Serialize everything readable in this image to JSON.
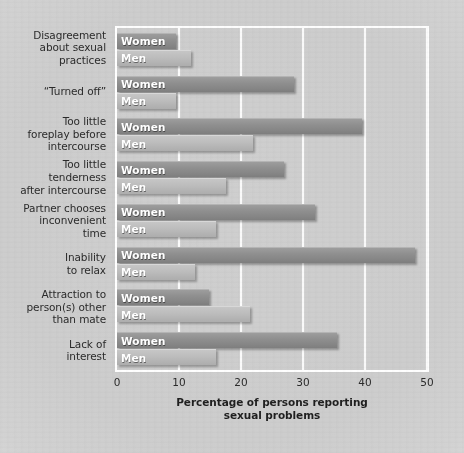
{
  "chart_data": {
    "type": "bar",
    "orientation": "horizontal",
    "title": "",
    "xlabel": "Percentage of persons reporting sexual problems",
    "ylabel": "",
    "xlim": [
      0,
      50
    ],
    "xticks": [
      0,
      10,
      20,
      30,
      40,
      50
    ],
    "grid": true,
    "legend": "in-bar labels",
    "series_names": [
      "Women",
      "Men"
    ],
    "categories": [
      "Disagreement about sexual practices",
      "“Turned off”",
      "Too little foreplay before intercourse",
      "Too little tenderness after intercourse",
      "Partner chooses inconvenient time",
      "Inability to relax",
      "Attraction to person(s) other than mate",
      "Lack of interest"
    ],
    "series": [
      {
        "name": "Women",
        "values": [
          9.5,
          28.5,
          39.5,
          27,
          32,
          48,
          14.8,
          35.5
        ]
      },
      {
        "name": "Men",
        "values": [
          12,
          9.5,
          22,
          17.5,
          16,
          12.5,
          21.5,
          16
        ]
      }
    ]
  },
  "categories": [
    {
      "lines": [
        "Disagreement",
        "about sexual",
        "practices"
      ],
      "women": 9.5,
      "men": 12
    },
    {
      "lines": [
        "“Turned off”"
      ],
      "women": 28.5,
      "men": 9.5
    },
    {
      "lines": [
        "Too little",
        "foreplay before",
        "intercourse"
      ],
      "women": 39.5,
      "men": 22
    },
    {
      "lines": [
        "Too little",
        "tenderness",
        "after intercourse"
      ],
      "women": 27,
      "men": 17.5
    },
    {
      "lines": [
        "Partner chooses",
        "inconvenient",
        "time"
      ],
      "women": 32,
      "men": 16
    },
    {
      "lines": [
        "Inability",
        "to relax"
      ],
      "women": 48,
      "men": 12.5
    },
    {
      "lines": [
        "Attraction to",
        "person(s) other",
        "than mate"
      ],
      "women": 14.8,
      "men": 21.5
    },
    {
      "lines": [
        "Lack of",
        "interest"
      ],
      "women": 35.5,
      "men": 16
    }
  ],
  "labels": {
    "women": "Women",
    "men": "Men"
  },
  "axis": {
    "ticks": [
      "0",
      "10",
      "20",
      "30",
      "40",
      "50"
    ],
    "title_line1": "Percentage of persons reporting",
    "title_line2": "sexual problems"
  },
  "colors": {
    "women_bar": "#8f8f8f",
    "men_bar": "#bcbcbc",
    "background": "#cdcdcd",
    "gridline": "#fbfbfb",
    "label_text": "#2b2b2b",
    "bar_text": "#ffffff"
  }
}
